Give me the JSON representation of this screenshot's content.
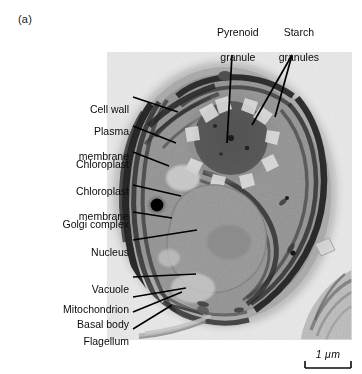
{
  "figure": {
    "panel_label": "(a)",
    "type": "transmission electron micrograph"
  },
  "labels": {
    "left": [
      {
        "id": "cell-wall",
        "text": "Cell wall",
        "lines": [
          "Cell wall"
        ]
      },
      {
        "id": "plasma-membrane",
        "text": "Plasma membrane",
        "lines": [
          "Plasma",
          "membrane"
        ]
      },
      {
        "id": "chloroplast",
        "text": "Chloroplast",
        "lines": [
          "Chloroplast"
        ]
      },
      {
        "id": "chloroplast-membrane",
        "text": "Chloroplast membrane",
        "lines": [
          "Chloroplast",
          "membrane"
        ]
      },
      {
        "id": "golgi-complex",
        "text": "Golgi complex",
        "lines": [
          "Golgi complex"
        ]
      },
      {
        "id": "nucleus",
        "text": "Nucleus",
        "lines": [
          "Nucleus"
        ]
      },
      {
        "id": "vacuole",
        "text": "Vacuole",
        "lines": [
          "Vacuole"
        ]
      },
      {
        "id": "mitochondrion",
        "text": "Mitochondrion",
        "lines": [
          "Mitochondrion"
        ]
      },
      {
        "id": "basal-body",
        "text": "Basal body",
        "lines": [
          "Basal body"
        ]
      },
      {
        "id": "flagellum",
        "text": "Flagellum",
        "lines": [
          "Flagellum"
        ]
      }
    ],
    "top": [
      {
        "id": "pyrenoid-granule",
        "text": "Pyrenoid granule",
        "lines": [
          "Pyrenoid",
          "granule"
        ]
      },
      {
        "id": "starch-granules",
        "text": "Starch granules",
        "lines": [
          "Starch",
          "granules"
        ]
      }
    ]
  },
  "label_text": {
    "cell_wall": "Cell wall",
    "plasma_membrane_l1": "Plasma",
    "plasma_membrane_l2": "membrane",
    "chloroplast": "Chloroplast",
    "chloroplast_membrane_l1": "Chloroplast",
    "chloroplast_membrane_l2": "membrane",
    "golgi_complex": "Golgi complex",
    "nucleus": "Nucleus",
    "vacuole": "Vacuole",
    "mitochondrion": "Mitochondrion",
    "basal_body": "Basal body",
    "flagellum": "Flagellum",
    "pyrenoid_granule_l1": "Pyrenoid",
    "pyrenoid_granule_l2": "granule",
    "starch_granules_l1": "Starch",
    "starch_granules_l2": "granules"
  },
  "scale_bar": {
    "label": "1 μm",
    "value": 1,
    "unit": "μm"
  },
  "colors": {
    "background": "#ffffff",
    "micrograph_background": "#efefef",
    "text": "#0b0b0b",
    "leader_line": "#000000",
    "cytoplasm": "#9a9a9a",
    "membrane_dark": "#161616",
    "pyrenoid": "#5e5e5e",
    "cell_wall": "#c9c9c9"
  }
}
